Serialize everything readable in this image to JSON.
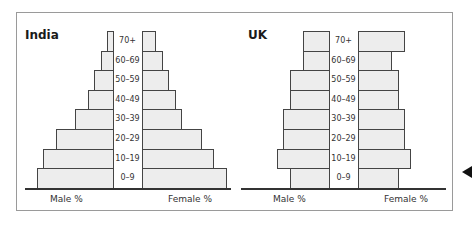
{
  "chart_data": [
    {
      "type": "bar",
      "subtype": "population-pyramid",
      "title": "India",
      "categories": [
        "0–9",
        "10–19",
        "20–29",
        "30–39",
        "40–49",
        "50–59",
        "60–69",
        "70+"
      ],
      "series": [
        {
          "name": "Male %",
          "values": [
            76,
            70,
            57,
            38,
            25,
            19,
            12,
            6
          ]
        },
        {
          "name": "Female %",
          "values": [
            84,
            71,
            59,
            39,
            33,
            26,
            20,
            13
          ]
        }
      ],
      "xlabel_left": "Male %",
      "xlabel_right": "Female %",
      "units_note": "relative bar lengths (no numeric axis shown)",
      "grid": false
    },
    {
      "type": "bar",
      "subtype": "population-pyramid",
      "title": "UK",
      "categories": [
        "0–9",
        "10–19",
        "20–29",
        "30–39",
        "40–49",
        "50–59",
        "60–69",
        "70+"
      ],
      "series": [
        {
          "name": "Male %",
          "values": [
            39,
            52,
            46,
            46,
            39,
            39,
            26,
            26
          ]
        },
        {
          "name": "Female %",
          "values": [
            40,
            52,
            46,
            46,
            40,
            40,
            33,
            46
          ]
        }
      ],
      "xlabel_left": "Male %",
      "xlabel_right": "Female %",
      "units_note": "relative bar lengths (no numeric axis shown)",
      "grid": false
    }
  ],
  "colors": {
    "bar_fill": "#ededed",
    "bar_stroke": "#444444",
    "frame": "#9a9a9a"
  }
}
